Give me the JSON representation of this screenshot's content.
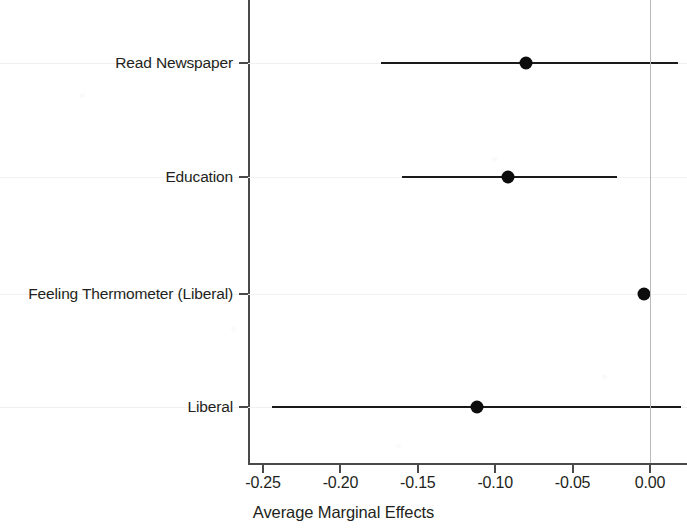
{
  "chart_data": {
    "type": "scatter",
    "subtype": "coefficient-plot-with-confidence-intervals",
    "title": "",
    "xlabel": "Average Marginal Effects",
    "ylabel": "",
    "xlim": [
      -0.27,
      0.025
    ],
    "xticks": [
      -0.25,
      -0.2,
      -0.15,
      -0.1,
      -0.05,
      0.0
    ],
    "xtick_labels": [
      "-0.25",
      "-0.20",
      "-0.15",
      "-0.10",
      "-0.05",
      "0.00"
    ],
    "categories": [
      "Read Newspaper",
      "Education",
      "Feeling Thermometer (Liberal)",
      "Liberal"
    ],
    "values": [
      -0.08,
      -0.092,
      -0.004,
      -0.112
    ],
    "ci_low": [
      -0.174,
      -0.16,
      -0.005,
      -0.244
    ],
    "ci_high": [
      0.018,
      -0.021,
      -0.003,
      0.02
    ],
    "points": [
      {
        "label": "Read Newspaper",
        "estimate": -0.08,
        "ci_low": -0.174,
        "ci_high": 0.018
      },
      {
        "label": "Education",
        "estimate": -0.092,
        "ci_low": -0.16,
        "ci_high": -0.021
      },
      {
        "label": "Feeling Thermometer (Liberal)",
        "estimate": -0.004,
        "ci_low": -0.005,
        "ci_high": -0.003
      },
      {
        "label": "Liberal",
        "estimate": -0.112,
        "ci_low": -0.244,
        "ci_high": 0.02
      }
    ],
    "reference_line": 0.0,
    "grid": false,
    "legend": "none",
    "colors": {
      "point": "#0d0d0d",
      "interval": "#1a1a1a",
      "axis": "#4a4a4a",
      "reference_line": "#b9b9b9",
      "text": "#231f20",
      "background": "#ffffff"
    }
  }
}
